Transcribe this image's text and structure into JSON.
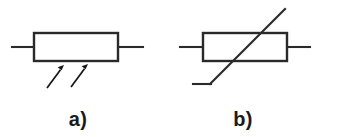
{
  "figure": {
    "background_color": "#ffffff",
    "line_color": "#2a2a2a",
    "arrow_color": "#161616",
    "caption_color": "#1a1a1a",
    "width": 363,
    "height": 137
  },
  "symbols": [
    {
      "id": "photoresistor",
      "caption": "a)",
      "component_name": "light-dependent-resistor",
      "body": {
        "x": 34,
        "y": 33,
        "width": 84,
        "height": 28
      },
      "lead_left": {
        "x1": 12,
        "y1": 47,
        "x2": 34,
        "y2": 47
      },
      "lead_right": {
        "x1": 118,
        "y1": 47,
        "x2": 143,
        "y2": 47
      },
      "arrows": [
        {
          "x1": 47,
          "y1": 88,
          "x2": 64,
          "y2": 65
        },
        {
          "x1": 71,
          "y1": 87,
          "x2": 88,
          "y2": 64
        }
      ],
      "caption_x": 78,
      "caption_y": 126
    },
    {
      "id": "variable-resistor",
      "caption": "b)",
      "component_name": "variable-resistor",
      "body": {
        "x": 203,
        "y": 33,
        "width": 84,
        "height": 28
      },
      "lead_left": {
        "x1": 180,
        "y1": 47,
        "x2": 203,
        "y2": 47
      },
      "lead_right": {
        "x1": 287,
        "y1": 47,
        "x2": 310,
        "y2": 47
      },
      "diagonal": {
        "x1": 210,
        "y1": 84,
        "x2": 285,
        "y2": 9
      },
      "tail": {
        "x1": 193,
        "y1": 84,
        "x2": 210,
        "y2": 84
      },
      "caption_x": 243,
      "caption_y": 126
    }
  ]
}
